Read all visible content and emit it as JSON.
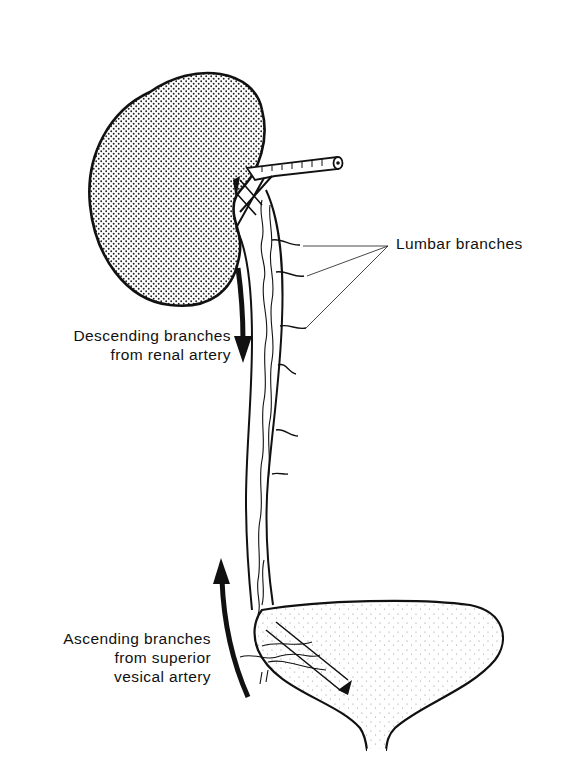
{
  "figure": {
    "background": "#ffffff",
    "ink_color": "#111111",
    "structures": {
      "kidney": "kidney",
      "renal_artery": "renal artery",
      "ureter": "ureter",
      "bladder": "bladder"
    },
    "labels": {
      "lumbar": {
        "lines": [
          "Lumbar branches"
        ]
      },
      "descending": {
        "lines": [
          "Descending branches",
          "from renal artery"
        ]
      },
      "ascending": {
        "lines": [
          "Ascending branches",
          "from superior",
          "vesical artery"
        ]
      }
    },
    "arrows": {
      "descending": {
        "direction": "down"
      },
      "ascending": {
        "direction": "up"
      }
    }
  }
}
